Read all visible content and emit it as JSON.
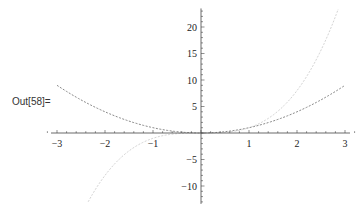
{
  "cell": {
    "out_label": "Out[58]="
  },
  "chart_data": {
    "type": "line",
    "title": "",
    "xlabel": "",
    "ylabel": "",
    "xlim": [
      -3,
      3
    ],
    "ylim": [
      -13,
      23.5
    ],
    "grid": false,
    "legend": null,
    "x_ticks": [
      -3,
      -2,
      -1,
      1,
      2,
      3
    ],
    "y_ticks": [
      -10,
      -5,
      5,
      10,
      15,
      20
    ],
    "series": [
      {
        "name": "x^2",
        "color": "#8a8a8a",
        "dash": "2,1.5",
        "x": [
          -3,
          -2.5,
          -2,
          -1.5,
          -1,
          -0.5,
          0,
          0.5,
          1,
          1.5,
          2,
          2.5,
          3
        ],
        "values": [
          9,
          6.25,
          4,
          2.25,
          1,
          0.25,
          0,
          0.25,
          1,
          2.25,
          4,
          6.25,
          9
        ]
      },
      {
        "name": "x^3",
        "color": "#d4d4d4",
        "dash": "2,1.5",
        "x": [
          -2.35,
          -2,
          -1.5,
          -1,
          -0.5,
          0,
          0.5,
          1,
          1.5,
          2,
          2.5,
          2.86
        ],
        "values": [
          -13,
          -8,
          -3.375,
          -1,
          -0.125,
          0,
          0.125,
          1,
          3.375,
          8,
          15.625,
          23.4
        ]
      }
    ]
  }
}
